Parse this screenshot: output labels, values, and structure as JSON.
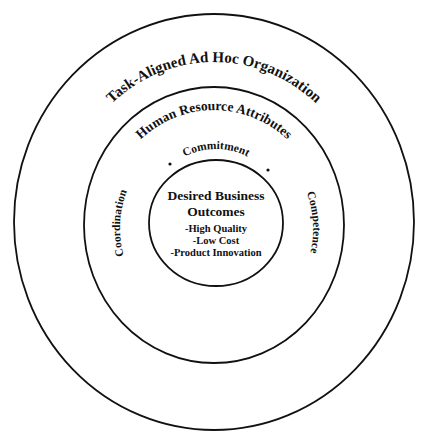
{
  "diagram": {
    "type": "concentric-circles",
    "outer_ring": {
      "label": "Task-Aligned Ad Hoc Organization"
    },
    "middle_ring": {
      "label": "Human Resource Attributes",
      "attributes": [
        "Coordination",
        "Commitment",
        "Competence"
      ]
    },
    "inner_circle": {
      "title_line1": "Desired Business",
      "title_line2": "Outcomes",
      "items": [
        "-High Quality",
        "-Low Cost",
        "-Product Innovation"
      ]
    },
    "colors": {
      "stroke": "#111111",
      "text": "#111111",
      "background": "#ffffff"
    }
  }
}
